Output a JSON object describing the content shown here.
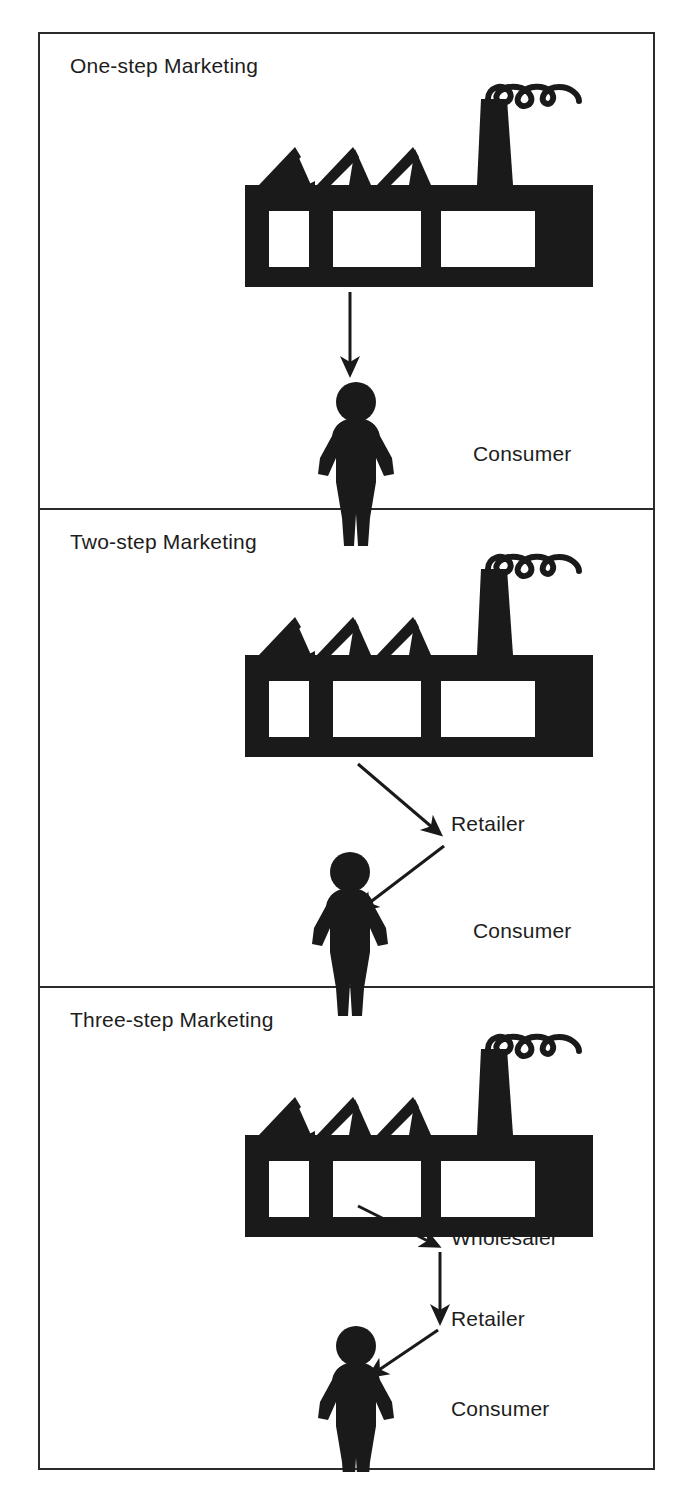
{
  "figure": {
    "background_color": "#ffffff",
    "ink_color": "#1d1d1d",
    "border_color": "#2b2b2b"
  },
  "panels": [
    {
      "id": "one-step",
      "title": "One-step Marketing",
      "nodes": [
        {
          "id": "producer",
          "label": "Producer",
          "icon": "factory-icon"
        },
        {
          "id": "consumer",
          "label": "Consumer",
          "icon": "person-icon"
        }
      ],
      "arrows": [
        {
          "from": "producer",
          "to": "consumer",
          "direction": "down"
        }
      ]
    },
    {
      "id": "two-step",
      "title": "Two-step Marketing",
      "nodes": [
        {
          "id": "producer",
          "label": "Producer",
          "icon": "factory-icon"
        },
        {
          "id": "retailer",
          "label": "Retailer",
          "icon": "none"
        },
        {
          "id": "consumer",
          "label": "Consumer",
          "icon": "person-icon"
        }
      ],
      "arrows": [
        {
          "from": "producer",
          "to": "retailer",
          "direction": "down-right"
        },
        {
          "from": "retailer",
          "to": "consumer",
          "direction": "down-left"
        }
      ]
    },
    {
      "id": "three-step",
      "title": "Three-step Marketing",
      "nodes": [
        {
          "id": "producer",
          "label": "Producer",
          "icon": "factory-icon"
        },
        {
          "id": "wholesaler",
          "label": "Wholesaler",
          "icon": "none"
        },
        {
          "id": "retailer",
          "label": "Retailer",
          "icon": "none"
        },
        {
          "id": "consumer",
          "label": "Consumer",
          "icon": "person-icon"
        }
      ],
      "arrows": [
        {
          "from": "producer",
          "to": "wholesaler",
          "direction": "down-right"
        },
        {
          "from": "wholesaler",
          "to": "retailer",
          "direction": "down"
        },
        {
          "from": "retailer",
          "to": "consumer",
          "direction": "down-left"
        }
      ]
    }
  ]
}
